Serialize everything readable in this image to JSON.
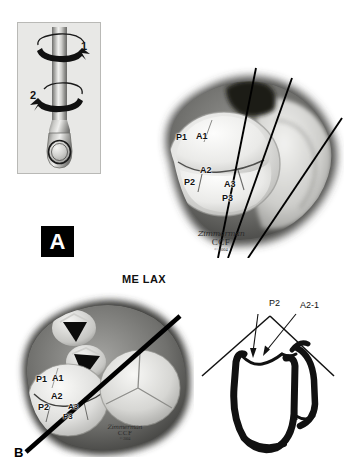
{
  "figure": {
    "panels": [
      {
        "tag": "A",
        "tag_style": "black-box-white-letter"
      },
      {
        "tag": "B",
        "tag_style": "plain-black-letter"
      }
    ],
    "caption": "ME LAX"
  },
  "probe_inset": {
    "name": "tee-probe-rotation-diagram",
    "rotation_labels": [
      {
        "id": "1",
        "text": "1",
        "direction": "clockwise-right"
      },
      {
        "id": "2",
        "text": "2",
        "direction": "counterclockwise-left"
      }
    ],
    "background_color": "#e8e8e6",
    "border_color": "#b9b9b6"
  },
  "panel_a": {
    "name": "mitral-valve-en-face-superior-view",
    "segment_labels": [
      {
        "id": "P1",
        "text": "P1"
      },
      {
        "id": "A1",
        "text": "A1"
      },
      {
        "id": "A2",
        "text": "A2"
      },
      {
        "id": "P2",
        "text": "P2"
      },
      {
        "id": "A3",
        "text": "A3"
      },
      {
        "id": "P3",
        "text": "P3"
      }
    ],
    "scan_lines": 3,
    "signature": {
      "artist": "Zimmerman",
      "institution": "CCF",
      "copyright": "© 2004"
    }
  },
  "panel_b": {
    "name": "mitral-valve-short-axis-cardiac-base-view",
    "segment_labels": [
      {
        "id": "P1",
        "text": "P1"
      },
      {
        "id": "A1",
        "text": "A1"
      },
      {
        "id": "A2",
        "text": "A2"
      },
      {
        "id": "P2",
        "text": "P2"
      },
      {
        "id": "A3",
        "text": "A3"
      },
      {
        "id": "P3",
        "text": "P3"
      }
    ],
    "scan_lines": 1,
    "signature": {
      "artist": "Zimmerman",
      "institution": "CCF",
      "copyright": "© 2004"
    }
  },
  "panel_c": {
    "name": "me-lax-schematic-heart",
    "labels": [
      {
        "id": "P2",
        "text": "P2"
      },
      {
        "id": "A2-1",
        "text": "A2-1"
      }
    ],
    "arrows": 2
  },
  "colors": {
    "ink": "#111111",
    "panel_tag_bg": "#000000",
    "panel_tag_fg": "#ffffff",
    "inset_bg": "#e8e8e6",
    "inset_border": "#b9b9b6",
    "page_bg": "#ffffff"
  }
}
